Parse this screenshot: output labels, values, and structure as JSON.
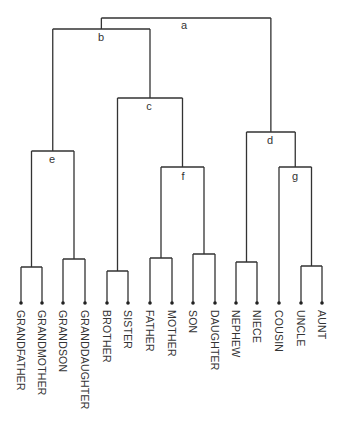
{
  "chart_data": {
    "type": "dendrogram",
    "title": "",
    "leaves": [
      "GRANDFATHER",
      "GRANDMOTHER",
      "GRANDSON",
      "GRANDDAUGHTER",
      "BROTHER",
      "SISTER",
      "FATHER",
      "MOTHER",
      "SON",
      "DAUGHTER",
      "NEPHEW",
      "NIECE",
      "COUSIN",
      "UNCLE",
      "AUNT"
    ],
    "leaf_x": [
      21,
      42,
      63,
      85,
      107,
      128,
      150,
      172,
      193,
      215,
      236,
      257,
      279,
      301,
      322
    ],
    "leaf_y": 303,
    "clusters": [
      {
        "id": "a",
        "children": [
          "b",
          "d"
        ],
        "y": 18,
        "label": "a",
        "label_x": 184,
        "label_y": 29
      },
      {
        "id": "b",
        "children": [
          "e",
          "c"
        ],
        "y": 29,
        "label": "b",
        "label_x": 101,
        "label_y": 41
      },
      {
        "id": "c",
        "children": [
          "BS",
          "f"
        ],
        "y": 98,
        "label": "c",
        "label_x": 149,
        "label_y": 110
      },
      {
        "id": "d",
        "children": [
          "NN",
          "g"
        ],
        "y": 132,
        "label": "d",
        "label_x": 270,
        "label_y": 144
      },
      {
        "id": "e",
        "children": [
          "GG1",
          "GG2"
        ],
        "y": 151,
        "label": "e",
        "label_x": 52,
        "label_y": 163
      },
      {
        "id": "f",
        "children": [
          "FM",
          "SD"
        ],
        "y": 167,
        "label": "f",
        "label_x": 183,
        "label_y": 180
      },
      {
        "id": "g",
        "children": [
          "COUSIN",
          "UA"
        ],
        "y": 167,
        "label": "g",
        "label_x": 295,
        "label_y": 180
      },
      {
        "id": "GG1",
        "children": [
          "GRANDFATHER",
          "GRANDMOTHER"
        ],
        "y": 267
      },
      {
        "id": "GG2",
        "children": [
          "GRANDSON",
          "GRANDDAUGHTER"
        ],
        "y": 259
      },
      {
        "id": "BS",
        "children": [
          "BROTHER",
          "SISTER"
        ],
        "y": 271
      },
      {
        "id": "FM",
        "children": [
          "FATHER",
          "MOTHER"
        ],
        "y": 258
      },
      {
        "id": "SD",
        "children": [
          "SON",
          "DAUGHTER"
        ],
        "y": 254
      },
      {
        "id": "NN",
        "children": [
          "NEPHEW",
          "NIECE"
        ],
        "y": 262
      },
      {
        "id": "UA",
        "children": [
          "UNCLE",
          "AUNT"
        ],
        "y": 266
      }
    ],
    "node_labels": [
      "a",
      "b",
      "c",
      "d",
      "e",
      "f",
      "g"
    ]
  }
}
